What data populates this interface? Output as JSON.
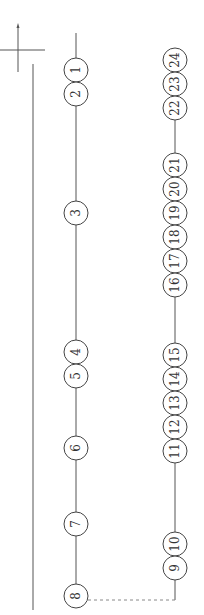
{
  "diagram": {
    "type": "numbered-node-chain",
    "orientation": "rotated-90",
    "colors": {
      "line": "#555555",
      "node_stroke": "#444444",
      "text": "#333333",
      "background": "#ffffff"
    },
    "axis_marker": {
      "x": 18,
      "y": 50,
      "arrow": "up"
    },
    "left_chain": {
      "x": 76,
      "nodes": [
        {
          "label": "1",
          "y": 70
        },
        {
          "label": "2",
          "y": 94
        },
        {
          "label": "3",
          "y": 213
        },
        {
          "label": "4",
          "y": 352
        },
        {
          "label": "5",
          "y": 376
        },
        {
          "label": "6",
          "y": 448
        },
        {
          "label": "7",
          "y": 524
        },
        {
          "label": "8",
          "y": 596
        }
      ]
    },
    "right_chain": {
      "x": 175,
      "nodes": [
        {
          "label": "24",
          "y": 60
        },
        {
          "label": "23",
          "y": 84
        },
        {
          "label": "22",
          "y": 108
        },
        {
          "label": "21",
          "y": 165
        },
        {
          "label": "20",
          "y": 189
        },
        {
          "label": "19",
          "y": 213
        },
        {
          "label": "18",
          "y": 237
        },
        {
          "label": "17",
          "y": 261
        },
        {
          "label": "16",
          "y": 285
        },
        {
          "label": "15",
          "y": 355
        },
        {
          "label": "14",
          "y": 379
        },
        {
          "label": "13",
          "y": 403
        },
        {
          "label": "12",
          "y": 427
        },
        {
          "label": "11",
          "y": 451
        },
        {
          "label": "10",
          "y": 544
        },
        {
          "label": "9",
          "y": 568
        }
      ]
    },
    "connector": {
      "from": "9",
      "to": "8",
      "style": "dashed",
      "y": 600
    }
  }
}
